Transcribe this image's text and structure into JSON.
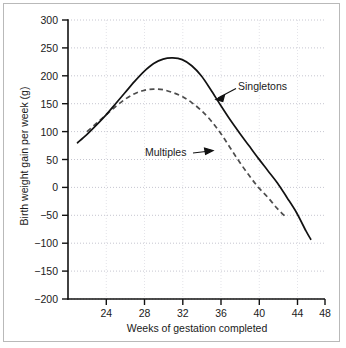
{
  "chart_data": {
    "type": "line",
    "title": "",
    "subtitle": "",
    "xlabel": "Weeks of gestation completed",
    "ylabel": "Birth weight gain per week (g)",
    "xlim": [
      22,
      49
    ],
    "ylim": [
      -200,
      300
    ],
    "xticks": [
      24,
      28,
      32,
      36,
      40,
      44,
      48
    ],
    "yticks": [
      300,
      250,
      200,
      150,
      100,
      50,
      0,
      -50,
      -100,
      -150,
      -200
    ],
    "xtick_labels": [
      "24",
      "28",
      "32",
      "36",
      "40",
      "44",
      "48"
    ],
    "ytick_labels": [
      "300",
      "250",
      "200",
      "150",
      "100",
      "50",
      "0",
      "−50",
      "−100",
      "−150",
      "−200"
    ],
    "grid": true,
    "grid_axis": "y",
    "grid_style": "dotted",
    "legend": "inline-annotations",
    "legend_position": "inline",
    "line_color": "#1a1a1a",
    "series": [
      {
        "name": "Singletons",
        "style": "solid",
        "color": "#1a1a1a",
        "x": [
          23,
          24,
          25,
          26,
          27,
          28,
          29,
          30,
          31,
          32,
          33,
          34,
          35,
          36,
          37,
          38,
          39,
          40,
          41,
          42,
          43,
          44,
          45,
          46,
          47,
          47.5
        ],
        "values": [
          80,
          95,
          112,
          130,
          150,
          170,
          190,
          208,
          222,
          230,
          232,
          229,
          218,
          200,
          175,
          148,
          122,
          98,
          75,
          52,
          30,
          8,
          -18,
          -45,
          -78,
          -93
        ]
      },
      {
        "name": "Multiples",
        "style": "dashed",
        "color": "#555555",
        "x": [
          24,
          25,
          26,
          27,
          28,
          29,
          30,
          31,
          32,
          33,
          34,
          35,
          36,
          37,
          38,
          39,
          40,
          41,
          42,
          43,
          44,
          45
        ],
        "values": [
          100,
          115,
          130,
          145,
          158,
          168,
          174,
          176,
          175,
          170,
          163,
          152,
          138,
          120,
          98,
          72,
          46,
          22,
          0,
          -18,
          -38,
          -55
        ]
      }
    ],
    "annotations": [
      {
        "label": "Singletons",
        "target_series": "Singletons",
        "arrow": "left-down"
      },
      {
        "label": "Multiples",
        "target_series": "Multiples",
        "arrow": "right"
      }
    ]
  },
  "axes": {
    "y_title": "Birth weight gain per week (g)",
    "x_title": "Weeks of gestation completed",
    "y_labels": [
      "300",
      "250",
      "200",
      "150",
      "100",
      "50",
      "0",
      "−50",
      "−100",
      "−150",
      "−200"
    ],
    "x_labels": [
      "24",
      "28",
      "32",
      "36",
      "40",
      "44",
      "48"
    ]
  },
  "annotations": {
    "singletons": "Singletons",
    "multiples": "Multiples"
  }
}
